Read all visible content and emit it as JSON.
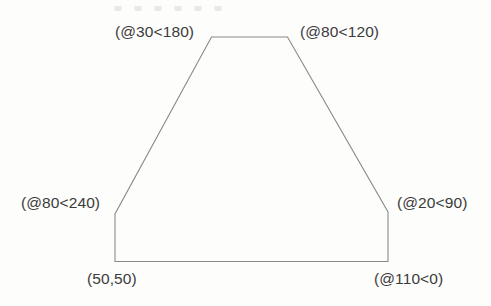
{
  "figure": {
    "type": "cad-polygon-annotation",
    "background_color": "#fdfdfc",
    "line_color": "#8a8a8a",
    "text_color": "#3b3b3b",
    "start_point_label": "(50,50)",
    "labels": [
      {
        "name": "top-left-vertex-label",
        "text": "(@30<180)",
        "x": 115,
        "y": 24
      },
      {
        "name": "top-right-vertex-label",
        "text": "(@80<120)",
        "x": 300,
        "y": 24
      },
      {
        "name": "middle-left-vertex-label",
        "text": "(@80<240)",
        "x": 21,
        "y": 195
      },
      {
        "name": "middle-right-vertex-label",
        "text": "(@20<90)",
        "x": 397,
        "y": 195
      },
      {
        "name": "bottom-left-vertex-label",
        "text": "(50,50)",
        "x": 87,
        "y": 271
      },
      {
        "name": "bottom-right-vertex-label",
        "text": "(@110<0)",
        "x": 374,
        "y": 271
      }
    ],
    "polygon": {
      "points": "115,261.5 115,214 211.5,37 287.5,37 388,212 388,261.5",
      "vertices": [
        {
          "name": "start",
          "label": "(50,50)",
          "x": 115,
          "y": 261.5
        },
        {
          "name": "middle-left",
          "label": "(@80<240)",
          "x": 115,
          "y": 214
        },
        {
          "name": "top-left",
          "label": "(@30<180)",
          "x": 211.5,
          "y": 37
        },
        {
          "name": "top-right",
          "label": "(@80<120)",
          "x": 287.5,
          "y": 37
        },
        {
          "name": "middle-right",
          "label": "(@20<90)",
          "x": 388,
          "y": 212
        },
        {
          "name": "bottom-right",
          "label": "(@110<0)",
          "x": 388,
          "y": 261.5
        }
      ]
    }
  }
}
